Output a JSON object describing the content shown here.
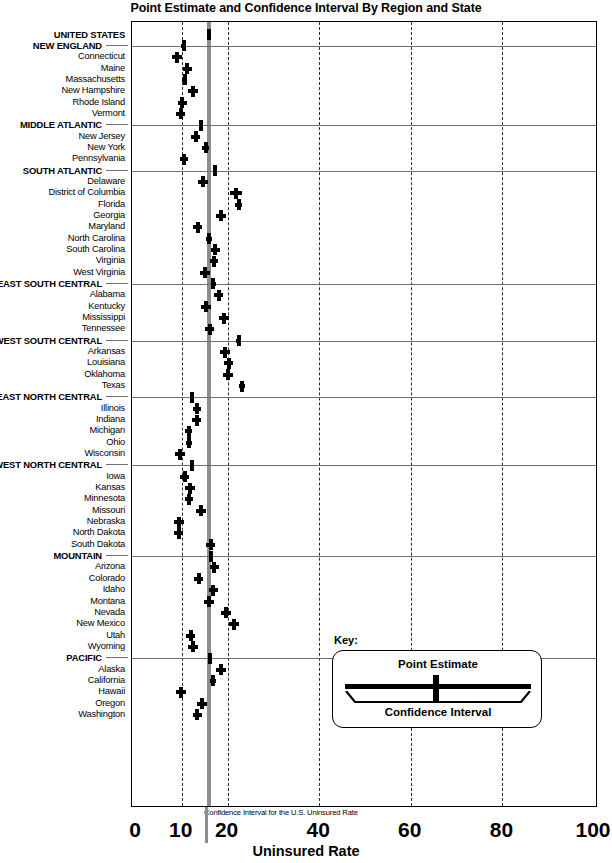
{
  "title": "Point Estimate and Confidence Interval By Region and State",
  "axis": {
    "title": "Uninsured  Rate",
    "ticks": [
      0,
      10,
      20,
      40,
      60,
      80,
      100
    ],
    "gridlines": [
      10,
      20,
      40,
      60,
      80
    ],
    "range": [
      0,
      100
    ]
  },
  "annotation": "Confidence Interval for the U.S. Uninsured Rate",
  "key": {
    "heading": "Key:",
    "point_estimate_label": "Point Estimate",
    "confidence_interval_label": "Confidence Interval"
  },
  "colors": {
    "marker": "#000000",
    "us_band": "#8d8d8d",
    "gridline": "#2b2b2b",
    "region_rule": "#6f6f6f",
    "frame": "#000000",
    "background": "#ffffff"
  },
  "chart_data": {
    "type": "scatter",
    "subtype": "forest-plot",
    "title": "Point Estimate and Confidence Interval By Region and State",
    "xlabel": "Uninsured  Rate",
    "ylabel": "",
    "xlim": [
      0,
      100
    ],
    "xticks": [
      0,
      10,
      20,
      40,
      60,
      80,
      100
    ],
    "grid": true,
    "legend": "inset key box",
    "us_reference_band": {
      "label": "Confidence Interval for the U.S. Uninsured Rate",
      "low": 15.6,
      "high": 16.4
    },
    "rows": [
      {
        "label": "UNITED STATES",
        "type": "region",
        "estimate": 16.0,
        "ci_low": 15.7,
        "ci_high": 16.3
      },
      {
        "label": "NEW ENGLAND",
        "type": "region",
        "estimate": 10.4,
        "ci_low": 9.9,
        "ci_high": 10.9
      },
      {
        "label": "Connecticut",
        "type": "state",
        "estimate": 9.0,
        "ci_low": 7.9,
        "ci_high": 10.1
      },
      {
        "label": "Maine",
        "type": "state",
        "estimate": 11.2,
        "ci_low": 10.2,
        "ci_high": 12.2
      },
      {
        "label": "Massachusetts",
        "type": "state",
        "estimate": 10.6,
        "ci_low": 10.0,
        "ci_high": 11.2
      },
      {
        "label": "New Hampshire",
        "type": "state",
        "estimate": 12.4,
        "ci_low": 11.3,
        "ci_high": 13.5
      },
      {
        "label": "Rhode Island",
        "type": "state",
        "estimate": 10.1,
        "ci_low": 9.1,
        "ci_high": 11.1
      },
      {
        "label": "Vermont",
        "type": "state",
        "estimate": 9.8,
        "ci_low": 8.8,
        "ci_high": 10.8
      },
      {
        "label": "MIDDLE ATLANTIC",
        "type": "region",
        "estimate": 14.2,
        "ci_low": 13.8,
        "ci_high": 14.6
      },
      {
        "label": "New Jersey",
        "type": "state",
        "estimate": 13.0,
        "ci_low": 12.1,
        "ci_high": 13.9
      },
      {
        "label": "New York",
        "type": "state",
        "estimate": 15.2,
        "ci_low": 14.5,
        "ci_high": 15.9
      },
      {
        "label": "Pennsylvania",
        "type": "state",
        "estimate": 10.4,
        "ci_low": 9.5,
        "ci_high": 11.3
      },
      {
        "label": "SOUTH ATLANTIC",
        "type": "region",
        "estimate": 17.3,
        "ci_low": 16.9,
        "ci_high": 17.7
      },
      {
        "label": "Delaware",
        "type": "state",
        "estimate": 14.7,
        "ci_low": 13.6,
        "ci_high": 15.8
      },
      {
        "label": "District of Columbia",
        "type": "state",
        "estimate": 21.9,
        "ci_low": 20.6,
        "ci_high": 23.2
      },
      {
        "label": "Florida",
        "type": "state",
        "estimate": 22.4,
        "ci_low": 21.6,
        "ci_high": 23.2
      },
      {
        "label": "Georgia",
        "type": "state",
        "estimate": 18.6,
        "ci_low": 17.5,
        "ci_high": 19.7
      },
      {
        "label": "Maryland",
        "type": "state",
        "estimate": 13.5,
        "ci_low": 12.5,
        "ci_high": 14.5
      },
      {
        "label": "North Carolina",
        "type": "state",
        "estimate": 15.9,
        "ci_low": 15.2,
        "ci_high": 16.6
      },
      {
        "label": "South Carolina",
        "type": "state",
        "estimate": 17.3,
        "ci_low": 16.3,
        "ci_high": 18.3
      },
      {
        "label": "Virginia",
        "type": "state",
        "estimate": 17.0,
        "ci_low": 16.1,
        "ci_high": 17.9
      },
      {
        "label": "West Virginia",
        "type": "state",
        "estimate": 15.1,
        "ci_low": 14.0,
        "ci_high": 16.2
      },
      {
        "label": "EAST SOUTH CENTRAL",
        "type": "region",
        "estimate": 16.9,
        "ci_low": 16.4,
        "ci_high": 17.4
      },
      {
        "label": "Alabama",
        "type": "state",
        "estimate": 18.1,
        "ci_low": 17.1,
        "ci_high": 19.1
      },
      {
        "label": "Kentucky",
        "type": "state",
        "estimate": 15.2,
        "ci_low": 14.1,
        "ci_high": 16.3
      },
      {
        "label": "Mississippi",
        "type": "state",
        "estimate": 19.2,
        "ci_low": 18.2,
        "ci_high": 20.2
      },
      {
        "label": "Tennessee",
        "type": "state",
        "estimate": 16.1,
        "ci_low": 15.1,
        "ci_high": 17.1
      },
      {
        "label": "WEST SOUTH CENTRAL",
        "type": "region",
        "estimate": 22.4,
        "ci_low": 21.9,
        "ci_high": 22.9
      },
      {
        "label": "Arkansas",
        "type": "state",
        "estimate": 19.4,
        "ci_low": 18.3,
        "ci_high": 20.5
      },
      {
        "label": "Louisiana",
        "type": "state",
        "estimate": 20.2,
        "ci_low": 19.2,
        "ci_high": 21.2
      },
      {
        "label": "Oklahoma",
        "type": "state",
        "estimate": 20.1,
        "ci_low": 19.0,
        "ci_high": 21.2
      },
      {
        "label": "Texas",
        "type": "state",
        "estimate": 23.1,
        "ci_low": 22.4,
        "ci_high": 23.8
      },
      {
        "label": "EAST NORTH CENTRAL",
        "type": "region",
        "estimate": 12.2,
        "ci_low": 11.8,
        "ci_high": 12.6
      },
      {
        "label": "Illinois",
        "type": "state",
        "estimate": 13.3,
        "ci_low": 12.5,
        "ci_high": 14.1
      },
      {
        "label": "Indiana",
        "type": "state",
        "estimate": 13.3,
        "ci_low": 12.3,
        "ci_high": 14.3
      },
      {
        "label": "Michigan",
        "type": "state",
        "estimate": 11.5,
        "ci_low": 10.8,
        "ci_high": 12.2
      },
      {
        "label": "Ohio",
        "type": "state",
        "estimate": 11.6,
        "ci_low": 11.0,
        "ci_high": 12.2
      },
      {
        "label": "Wisconsin",
        "type": "state",
        "estimate": 9.6,
        "ci_low": 8.6,
        "ci_high": 10.6
      },
      {
        "label": "WEST NORTH CENTRAL",
        "type": "region",
        "estimate": 12.2,
        "ci_low": 11.7,
        "ci_high": 12.7
      },
      {
        "label": "Iowa",
        "type": "state",
        "estimate": 10.6,
        "ci_low": 9.6,
        "ci_high": 11.6
      },
      {
        "label": "Kansas",
        "type": "state",
        "estimate": 11.8,
        "ci_low": 10.8,
        "ci_high": 12.8
      },
      {
        "label": "Minnesota",
        "type": "state",
        "estimate": 11.6,
        "ci_low": 10.7,
        "ci_high": 12.5
      },
      {
        "label": "Missouri",
        "type": "state",
        "estimate": 14.2,
        "ci_low": 13.2,
        "ci_high": 15.2
      },
      {
        "label": "Nebraska",
        "type": "state",
        "estimate": 9.4,
        "ci_low": 8.4,
        "ci_high": 10.4
      },
      {
        "label": "North Dakota",
        "type": "state",
        "estimate": 9.3,
        "ci_low": 8.3,
        "ci_high": 10.3
      },
      {
        "label": "South Dakota",
        "type": "state",
        "estimate": 16.3,
        "ci_low": 15.3,
        "ci_high": 17.3
      },
      {
        "label": "MOUNTAIN",
        "type": "region",
        "estimate": 16.4,
        "ci_low": 15.9,
        "ci_high": 16.9
      },
      {
        "label": "Arizona",
        "type": "state",
        "estimate": 17.1,
        "ci_low": 16.1,
        "ci_high": 18.1
      },
      {
        "label": "Colorado",
        "type": "state",
        "estimate": 13.7,
        "ci_low": 12.7,
        "ci_high": 14.7
      },
      {
        "label": "Idaho",
        "type": "state",
        "estimate": 16.9,
        "ci_low": 15.9,
        "ci_high": 17.9
      },
      {
        "label": "Montana",
        "type": "state",
        "estimate": 16.0,
        "ci_low": 14.9,
        "ci_high": 17.1
      },
      {
        "label": "Nevada",
        "type": "state",
        "estimate": 19.6,
        "ci_low": 18.5,
        "ci_high": 20.7
      },
      {
        "label": "New Mexico",
        "type": "state",
        "estimate": 21.5,
        "ci_low": 20.4,
        "ci_high": 22.6
      },
      {
        "label": "Utah",
        "type": "state",
        "estimate": 11.9,
        "ci_low": 10.9,
        "ci_high": 12.9
      },
      {
        "label": "Wyoming",
        "type": "state",
        "estimate": 12.4,
        "ci_low": 11.3,
        "ci_high": 13.5
      },
      {
        "label": "PACIFIC",
        "type": "region",
        "estimate": 16.2,
        "ci_low": 15.8,
        "ci_high": 16.6
      },
      {
        "label": "Alaska",
        "type": "state",
        "estimate": 18.5,
        "ci_low": 17.4,
        "ci_high": 19.6
      },
      {
        "label": "California",
        "type": "state",
        "estimate": 16.8,
        "ci_low": 16.2,
        "ci_high": 17.4
      },
      {
        "label": "Hawaii",
        "type": "state",
        "estimate": 9.8,
        "ci_low": 8.7,
        "ci_high": 10.9
      },
      {
        "label": "Oregon",
        "type": "state",
        "estimate": 14.4,
        "ci_low": 13.4,
        "ci_high": 15.4
      },
      {
        "label": "Washington",
        "type": "state",
        "estimate": 13.4,
        "ci_low": 12.4,
        "ci_high": 14.4
      }
    ]
  }
}
